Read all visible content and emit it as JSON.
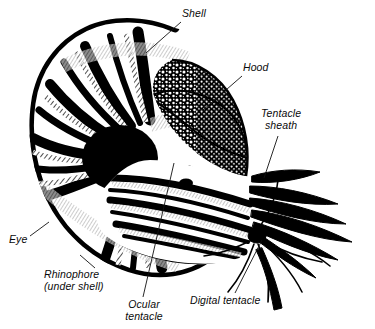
{
  "figure": {
    "organism": "Chambered nautilus",
    "width": 375,
    "height": 329,
    "background_color": "#ffffff",
    "ink_color": "#000000",
    "style": "black-and-white stipple and hatch line engraving"
  },
  "labels": [
    {
      "id": "shell",
      "name": "shell",
      "lines": [
        "Shell"
      ],
      "x": 182,
      "y": 8,
      "align": "left",
      "leader": {
        "x1": 181,
        "y1": 22,
        "x2": 146,
        "y2": 53
      }
    },
    {
      "id": "hood",
      "name": "hood",
      "lines": [
        "Hood"
      ],
      "x": 243,
      "y": 62,
      "align": "left",
      "leader": {
        "x1": 242,
        "y1": 76,
        "x2": 203,
        "y2": 110
      }
    },
    {
      "id": "tentacle-sheath",
      "name": "tentacle-sheath",
      "lines": [
        "Tentacle",
        "sheath"
      ],
      "x": 261,
      "y": 108,
      "align": "left",
      "leader": {
        "x1": 278,
        "y1": 136,
        "x2": 264,
        "y2": 178
      }
    },
    {
      "id": "eye",
      "name": "eye",
      "lines": [
        "Eye"
      ],
      "x": 9,
      "y": 234,
      "align": "left",
      "leader": {
        "x1": 30,
        "y1": 236,
        "x2": 49,
        "y2": 222
      }
    },
    {
      "id": "rhinophore",
      "name": "rhinophore",
      "lines": [
        "Rhinophore",
        "(under shell)"
      ],
      "x": 44,
      "y": 269,
      "align": "left",
      "leader": {
        "x1": 95,
        "y1": 268,
        "x2": 80,
        "y2": 255
      }
    },
    {
      "id": "ocular-tentacle",
      "name": "ocular-tentacle",
      "lines": [
        "Ocular",
        "tentacle"
      ],
      "x": 118,
      "y": 299,
      "align": "center",
      "leader": {
        "x1": 143,
        "y1": 297,
        "x2": 174,
        "y2": 163
      }
    },
    {
      "id": "digital-tentacle",
      "name": "digital-tentacle",
      "lines": [
        "Digital tentacle"
      ],
      "x": 190,
      "y": 295,
      "align": "left",
      "leader": {
        "x1": 235,
        "y1": 293,
        "x2": 262,
        "y2": 240
      }
    }
  ],
  "anatomy_parts": [
    "Shell",
    "Hood",
    "Tentacle sheath",
    "Eye",
    "Rhinophore (under shell)",
    "Ocular tentacle",
    "Digital tentacle"
  ]
}
